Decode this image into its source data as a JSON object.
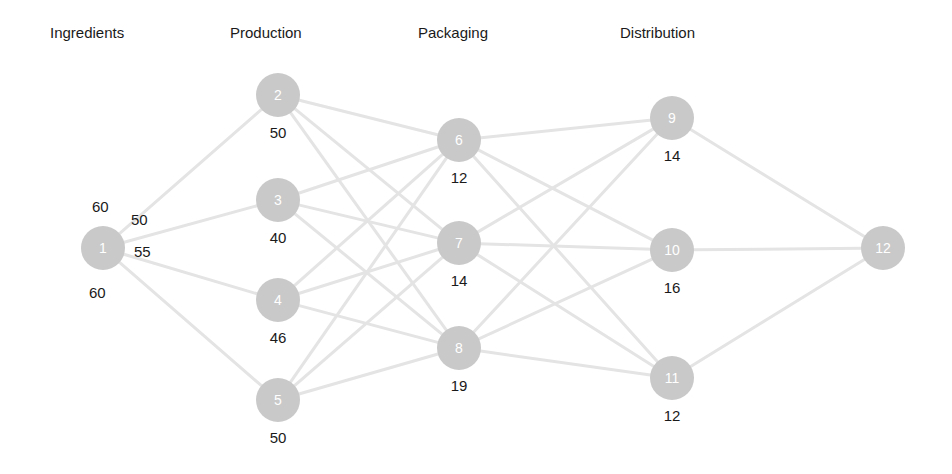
{
  "diagram": {
    "title_row": {
      "stages": [
        {
          "label": "Ingredients",
          "x": 50,
          "y": 24
        },
        {
          "label": "Production",
          "x": 230,
          "y": 24
        },
        {
          "label": "Packaging",
          "x": 418,
          "y": 24
        },
        {
          "label": "Distribution",
          "x": 620,
          "y": 24
        }
      ]
    },
    "colors": {
      "node_fill": "#c9c9c9",
      "node_text": "#ffffff",
      "edge": "#e2e2e2",
      "label_text": "#1a1a1a",
      "background": "#ffffff"
    },
    "nodes": [
      {
        "id": "1",
        "label": "1",
        "cx": 103,
        "cy": 248,
        "r": 22,
        "value": null,
        "stage": "Ingredients"
      },
      {
        "id": "2",
        "label": "2",
        "cx": 278,
        "cy": 95,
        "r": 22,
        "value": "50",
        "stage": "Production"
      },
      {
        "id": "3",
        "label": "3",
        "cx": 278,
        "cy": 200,
        "r": 22,
        "value": "40",
        "stage": "Production"
      },
      {
        "id": "4",
        "label": "4",
        "cx": 278,
        "cy": 300,
        "r": 22,
        "value": "46",
        "stage": "Production"
      },
      {
        "id": "5",
        "label": "5",
        "cx": 278,
        "cy": 400,
        "r": 22,
        "value": "50",
        "stage": "Production"
      },
      {
        "id": "6",
        "label": "6",
        "cx": 459,
        "cy": 140,
        "r": 22,
        "value": "12",
        "stage": "Packaging"
      },
      {
        "id": "7",
        "label": "7",
        "cx": 459,
        "cy": 243,
        "r": 22,
        "value": "14",
        "stage": "Packaging"
      },
      {
        "id": "8",
        "label": "8",
        "cx": 459,
        "cy": 348,
        "r": 22,
        "value": "19",
        "stage": "Packaging"
      },
      {
        "id": "9",
        "label": "9",
        "cx": 672,
        "cy": 118,
        "r": 22,
        "value": "14",
        "stage": "Distribution"
      },
      {
        "id": "10",
        "label": "10",
        "cx": 672,
        "cy": 250,
        "r": 22,
        "value": "16",
        "stage": "Distribution"
      },
      {
        "id": "11",
        "label": "11",
        "cx": 672,
        "cy": 378,
        "r": 22,
        "value": "12",
        "stage": "Distribution"
      },
      {
        "id": "12",
        "label": "12",
        "cx": 883,
        "cy": 248,
        "r": 22,
        "value": null,
        "stage": "Distribution"
      }
    ],
    "edges": [
      {
        "from": "1",
        "to": "2"
      },
      {
        "from": "1",
        "to": "3"
      },
      {
        "from": "1",
        "to": "4"
      },
      {
        "from": "1",
        "to": "5"
      },
      {
        "from": "2",
        "to": "6"
      },
      {
        "from": "2",
        "to": "7"
      },
      {
        "from": "2",
        "to": "8"
      },
      {
        "from": "3",
        "to": "6"
      },
      {
        "from": "3",
        "to": "7"
      },
      {
        "from": "3",
        "to": "8"
      },
      {
        "from": "4",
        "to": "6"
      },
      {
        "from": "4",
        "to": "7"
      },
      {
        "from": "4",
        "to": "8"
      },
      {
        "from": "5",
        "to": "6"
      },
      {
        "from": "5",
        "to": "7"
      },
      {
        "from": "5",
        "to": "8"
      },
      {
        "from": "6",
        "to": "9"
      },
      {
        "from": "6",
        "to": "10"
      },
      {
        "from": "6",
        "to": "11"
      },
      {
        "from": "7",
        "to": "9"
      },
      {
        "from": "7",
        "to": "10"
      },
      {
        "from": "7",
        "to": "11"
      },
      {
        "from": "8",
        "to": "9"
      },
      {
        "from": "8",
        "to": "10"
      },
      {
        "from": "8",
        "to": "11"
      },
      {
        "from": "9",
        "to": "12"
      },
      {
        "from": "10",
        "to": "12"
      },
      {
        "from": "11",
        "to": "12"
      }
    ],
    "edge_labels": [
      {
        "text": "60",
        "x": 92,
        "y": 198,
        "for": "1-2"
      },
      {
        "text": "50",
        "x": 131,
        "y": 211,
        "for": "1-3"
      },
      {
        "text": "55",
        "x": 134,
        "y": 243,
        "for": "1-4"
      },
      {
        "text": "60",
        "x": 89,
        "y": 284,
        "for": "1-5"
      }
    ]
  },
  "chart_data": {
    "type": "diagram",
    "title": "",
    "stages": [
      "Ingredients",
      "Production",
      "Packaging",
      "Distribution"
    ],
    "node_values": {
      "1": null,
      "2": 50,
      "3": 40,
      "4": 46,
      "5": 50,
      "6": 12,
      "7": 14,
      "8": 19,
      "9": 14,
      "10": 16,
      "11": 12,
      "12": null
    },
    "flow_labels": {
      "1-2": 60,
      "1-3": 50,
      "1-4": 55,
      "1-5": 60
    },
    "legend": "none",
    "grid": false
  }
}
